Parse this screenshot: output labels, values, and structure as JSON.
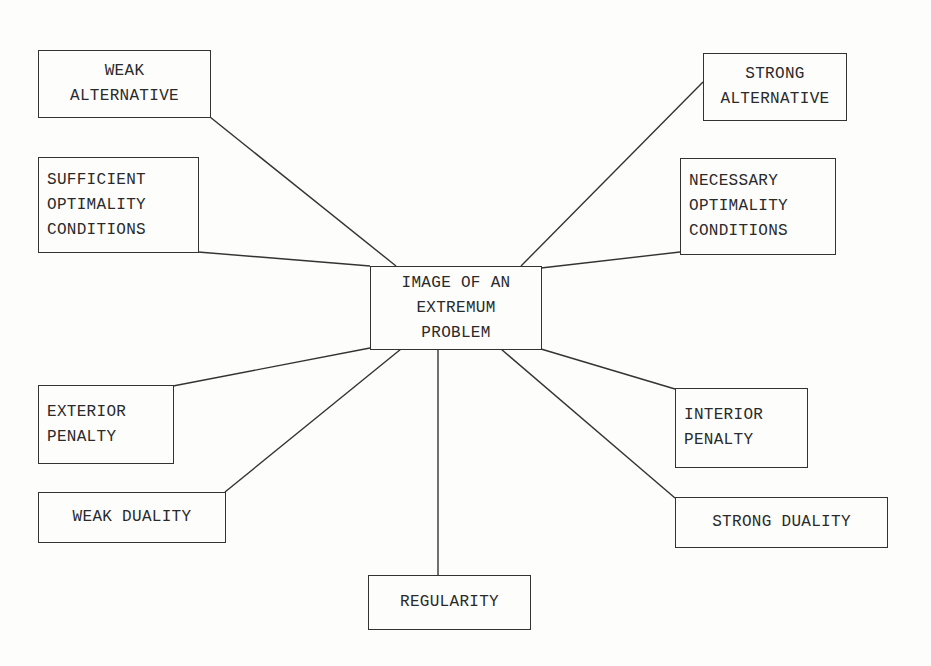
{
  "diagram": {
    "center": {
      "lines": [
        "IMAGE OF AN",
        "EXTREMUM",
        "PROBLEM"
      ]
    },
    "nodes": [
      {
        "id": "weak-alternative",
        "lines": [
          "WEAK",
          "ALTERNATIVE"
        ]
      },
      {
        "id": "sufficient-optimality-conditions",
        "lines": [
          "SUFFICIENT",
          "OPTIMALITY",
          "CONDITIONS"
        ]
      },
      {
        "id": "strong-alternative",
        "lines": [
          "STRONG",
          "ALTERNATIVE"
        ]
      },
      {
        "id": "necessary-optimality-conditions",
        "lines": [
          "NECESSARY",
          "OPTIMALITY",
          "CONDITIONS"
        ]
      },
      {
        "id": "exterior-penalty",
        "lines": [
          "EXTERIOR",
          "PENALTY"
        ]
      },
      {
        "id": "weak-duality",
        "lines": [
          "WEAK DUALITY"
        ]
      },
      {
        "id": "interior-penalty",
        "lines": [
          "INTERIOR",
          "PENALTY"
        ]
      },
      {
        "id": "strong-duality",
        "lines": [
          "STRONG DUALITY"
        ]
      },
      {
        "id": "regularity",
        "lines": [
          "REGULARITY"
        ]
      }
    ],
    "edges": [
      [
        "center",
        "weak-alternative"
      ],
      [
        "center",
        "sufficient-optimality-conditions"
      ],
      [
        "center",
        "strong-alternative"
      ],
      [
        "center",
        "necessary-optimality-conditions"
      ],
      [
        "center",
        "exterior-penalty"
      ],
      [
        "center",
        "weak-duality"
      ],
      [
        "center",
        "interior-penalty"
      ],
      [
        "center",
        "strong-duality"
      ],
      [
        "center",
        "regularity"
      ]
    ]
  }
}
